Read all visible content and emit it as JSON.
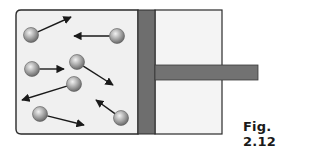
{
  "figure": {
    "caption": "Fig. 2.12",
    "colors": {
      "container_fill": "#f0f0f0",
      "border": "#2a2a2a",
      "piston": "#6e6e6e",
      "particle": "#a9a9a9",
      "arrow": "#1a1a1a"
    },
    "particles": [
      {
        "cx": 31,
        "cy": 35,
        "x2": 71,
        "y2": 17
      },
      {
        "cx": 117,
        "cy": 36,
        "x2": 74,
        "y2": 36
      },
      {
        "cx": 32,
        "cy": 69,
        "x2": 64,
        "y2": 69
      },
      {
        "cx": 77,
        "cy": 62,
        "x2": 113,
        "y2": 85
      },
      {
        "cx": 74,
        "cy": 84,
        "x2": 22,
        "y2": 100
      },
      {
        "cx": 40,
        "cy": 114,
        "x2": 84,
        "y2": 125
      },
      {
        "cx": 121,
        "cy": 118,
        "x2": 96,
        "y2": 100
      }
    ]
  }
}
